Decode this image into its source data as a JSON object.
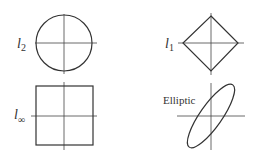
{
  "panels": [
    {
      "id": "l2",
      "label": "l",
      "subscript": "2",
      "shape": "circle"
    },
    {
      "id": "l1",
      "label": "l",
      "subscript": "1",
      "shape": "diamond"
    },
    {
      "id": "linf",
      "label": "l",
      "subscript": "∞",
      "shape": "square"
    },
    {
      "id": "elliptic",
      "label": "Elliptic",
      "shape": "ellipse"
    }
  ],
  "colors": {
    "stroke": "#333333",
    "background": "#ffffff"
  }
}
